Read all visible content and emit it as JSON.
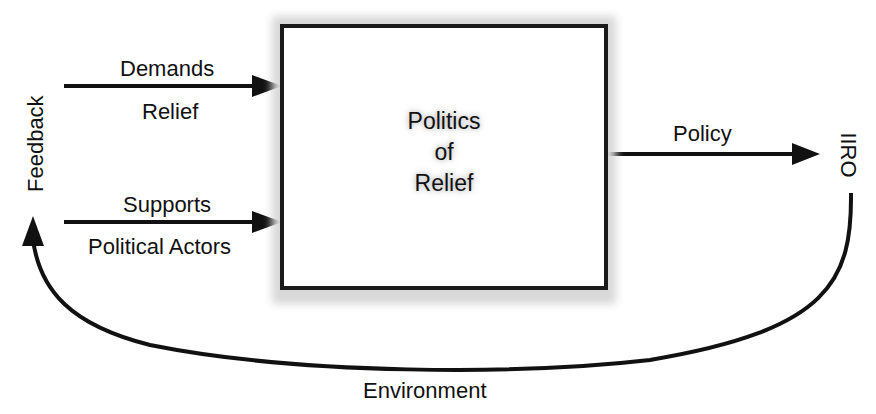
{
  "diagram": {
    "box": {
      "lines": [
        "Politics",
        "of",
        "Relief"
      ]
    },
    "inputs": [
      {
        "above": "Demands",
        "below": "Relief"
      },
      {
        "above": "Supports",
        "below": "Political Actors"
      }
    ],
    "output": {
      "label": "Policy"
    },
    "outcome": {
      "label": "IIRO"
    },
    "feedback": {
      "label": "Feedback"
    },
    "environment": {
      "label": "Environment"
    },
    "colors": {
      "stroke": "#111111",
      "background": "#ffffff",
      "box_shadow": "#d8d8d8"
    }
  }
}
